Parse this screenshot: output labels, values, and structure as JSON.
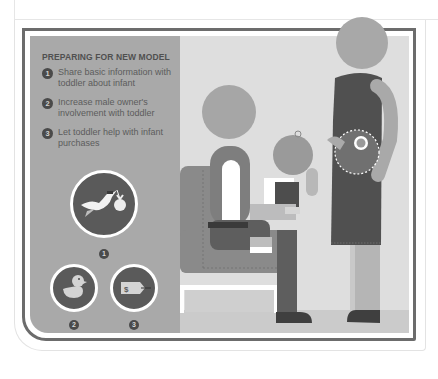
{
  "panel": {
    "title": "PREPARING FOR NEW MODEL",
    "items": [
      {
        "number": "1",
        "text": "Share basic information with toddler about infant"
      },
      {
        "number": "2",
        "text": "Increase male owner's involvement with toddler"
      },
      {
        "number": "3",
        "text": "Let toddler help with infant purchases"
      }
    ]
  },
  "icons": [
    {
      "number": "1",
      "name": "stork-delivering-baby-icon"
    },
    {
      "number": "2",
      "name": "rubber-duck-icon"
    },
    {
      "number": "3",
      "name": "price-tag-icon",
      "tag_label": "$"
    }
  ],
  "scene": {
    "figures": [
      "seated-father",
      "toddler-on-lap",
      "pregnant-mother-with-infant"
    ]
  },
  "colors": {
    "panel": "#a9a9a9",
    "scene_bg": "#dedede",
    "frame": "#6c6c6c",
    "dark": "#4a4a4a"
  }
}
